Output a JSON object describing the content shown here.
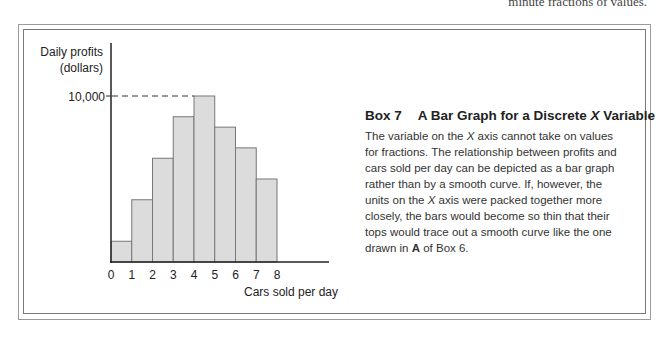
{
  "page": {
    "top_snippet": "minute fractions of values."
  },
  "chart_data": {
    "type": "bar",
    "xlabel": "Cars sold per day",
    "ylabel": "Daily profits (dollars)",
    "ylabel_line1": "Daily profits",
    "ylabel_line2": "(dollars)",
    "categories": [
      "0",
      "1",
      "2",
      "3",
      "4",
      "5",
      "6",
      "7"
    ],
    "x_tick_labels": [
      "0",
      "1",
      "2",
      "3",
      "4",
      "5",
      "6",
      "7",
      "8"
    ],
    "values": [
      1250,
      3750,
      6250,
      8750,
      10000,
      8125,
      6875,
      5000
    ],
    "y_tick_labels": [
      "10,000"
    ],
    "y_ticks": [
      10000
    ],
    "ylim": [
      0,
      10000
    ],
    "grid": false,
    "annotations": [
      "dashed reference line at 10,000 to the top of the tallest bar (4 cars)"
    ],
    "bar_color": "#dcdcdc",
    "bar_edge_color": "#777777"
  },
  "box": {
    "number": "Box 7",
    "title_prefix": "A Bar Graph for a Discrete ",
    "title_var": "X",
    "title_suffix": " Variable",
    "body_1": "The variable on the ",
    "body_x1": "X",
    "body_2": " axis cannot take on values for fractions. The relationship between profits and cars sold per day can be depicted as a  bar graph rather than by a smooth curve. If, however, the units on the ",
    "body_x2": "X",
    "body_3": " axis were packed together more closely, the bars would become so thin that their tops would trace out a smooth curve like the one drawn in ",
    "body_bold": "A",
    "body_4": " of Box 6."
  }
}
